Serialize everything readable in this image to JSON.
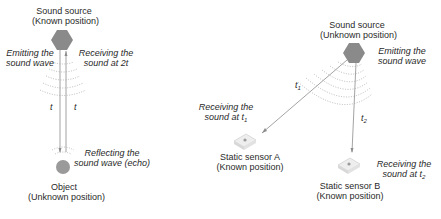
{
  "left_diagram": {
    "source": {
      "title": "Sound source",
      "subtitle": "(Known position)"
    },
    "emit_label": {
      "line1": "Emitting the",
      "line2": "sound wave"
    },
    "receive_label": {
      "line1": "Receiving the",
      "line2": "sound at 2t"
    },
    "time_down": "t",
    "time_up": "t",
    "reflect_label": {
      "line1": "Reflecting the",
      "line2": "sound wave (echo)"
    },
    "object": {
      "title": "Object",
      "subtitle": "(Unknown position)"
    }
  },
  "right_diagram": {
    "source": {
      "title": "Sound source",
      "subtitle": "(Unknown position)"
    },
    "emit_label": {
      "line1": "Emitting the",
      "line2": "sound wave"
    },
    "t1": {
      "base": "t",
      "sub": "1"
    },
    "t2": {
      "base": "t",
      "sub": "2"
    },
    "receive_a": {
      "line1": "Receiving the",
      "line2_base": "sound at t",
      "line2_sub": "1"
    },
    "receive_b": {
      "line1": "Receiving the",
      "line2_base": "sound at t",
      "line2_sub": "2"
    },
    "sensor_a": {
      "title": "Static sensor A",
      "subtitle": "(Known position)"
    },
    "sensor_b": {
      "title": "Static sensor B",
      "subtitle": "(Known position)"
    }
  },
  "colors": {
    "hexagon": "#8a8a8a",
    "object": "#9a9a9a",
    "line": "#8c8c8c",
    "arc": "#a8a8a8",
    "sensor": "#eeeeee"
  }
}
